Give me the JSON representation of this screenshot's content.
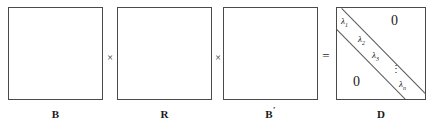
{
  "figure": {
    "type": "matrix-equation-diagram",
    "background_color": "#ffffff",
    "stroke_color": "#4a4a4a",
    "text_color": "#1a1a1a"
  },
  "matrices": [
    {
      "label": "B",
      "prime": "",
      "name": "matrix-b",
      "kind": "empty-square"
    },
    {
      "label": "R",
      "prime": "",
      "name": "matrix-r",
      "kind": "empty-square"
    },
    {
      "label": "B",
      "prime": "′",
      "name": "matrix-b-prime",
      "kind": "empty-square"
    },
    {
      "label": "D",
      "prime": "",
      "name": "matrix-d",
      "kind": "diagonal"
    }
  ],
  "operators": {
    "times_1": "×",
    "times_2": "×",
    "equals": "="
  },
  "diagonal_matrix": {
    "entries": [
      {
        "text": "λ",
        "sub": "1"
      },
      {
        "text": "λ",
        "sub": "2"
      },
      {
        "text": "λ",
        "sub": "3"
      },
      {
        "text": "λ",
        "sub": "n"
      }
    ],
    "ellipsis": "⋮",
    "zero_upper_right": "0",
    "zero_lower_left": "0"
  }
}
